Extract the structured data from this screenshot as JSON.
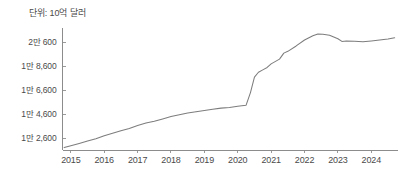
{
  "chart_data": {
    "type": "line",
    "title": "단위: 10억 달러",
    "xlabel": "",
    "ylabel": "",
    "grid": false,
    "legend": false,
    "axis_line_color": "#8c8c8c",
    "line_color": "#7d7d7d",
    "background_color": "#ffffff",
    "xlim": [
      2014.75,
      2024.8
    ],
    "ylim": [
      11600,
      21800
    ],
    "yticks": [
      12600,
      14600,
      16600,
      18600,
      20600
    ],
    "ytick_labels": [
      "1만 2,600",
      "1만 4,600",
      "1만 6,600",
      "1만 8,600",
      "2만 600"
    ],
    "xticks": [
      2015,
      2016,
      2017,
      2018,
      2019,
      2020,
      2021,
      2022,
      2023,
      2024
    ],
    "xtick_labels": [
      "2015",
      "2016",
      "2017",
      "2018",
      "2019",
      "2020",
      "2021",
      "2022",
      "2023",
      "2024"
    ],
    "series": [
      {
        "name": "총액",
        "x": [
          2014.8,
          2015.0,
          2015.25,
          2015.5,
          2015.75,
          2016.0,
          2016.25,
          2016.5,
          2016.75,
          2017.0,
          2017.25,
          2017.5,
          2017.75,
          2018.0,
          2018.25,
          2018.5,
          2018.75,
          2019.0,
          2019.25,
          2019.5,
          2019.75,
          2020.0,
          2020.12,
          2020.25,
          2020.38,
          2020.5,
          2020.62,
          2020.75,
          2020.88,
          2021.0,
          2021.25,
          2021.38,
          2021.5,
          2021.75,
          2022.0,
          2022.25,
          2022.4,
          2022.55,
          2022.75,
          2023.0,
          2023.12,
          2023.25,
          2023.5,
          2023.75,
          2024.0,
          2024.25,
          2024.5,
          2024.7
        ],
        "values": [
          11800,
          11950,
          12150,
          12350,
          12550,
          12800,
          13000,
          13200,
          13400,
          13650,
          13850,
          14000,
          14200,
          14400,
          14550,
          14700,
          14800,
          14900,
          15000,
          15100,
          15150,
          15250,
          15300,
          15350,
          16400,
          17700,
          18100,
          18300,
          18500,
          18800,
          19200,
          19700,
          19850,
          20300,
          20800,
          21150,
          21300,
          21280,
          21200,
          20900,
          20680,
          20720,
          20700,
          20650,
          20720,
          20800,
          20880,
          20980
        ]
      }
    ]
  }
}
